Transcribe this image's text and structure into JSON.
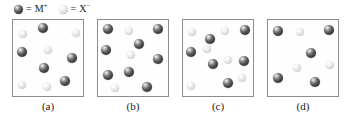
{
  "figure": {
    "caption_labels": [
      "(a)",
      "(b)",
      "(c)",
      "(d)"
    ],
    "colors": {
      "cation_dark": "#3a3a3a",
      "anion_light": "#dcdcdc",
      "box_border": "#8d8d8d",
      "text": "#1a1a1a",
      "background": "#ffffff"
    }
  },
  "legend": {
    "items": [
      {
        "icon": "dark-sphere-icon",
        "equals": "=",
        "species": "M",
        "charge": "+",
        "label": "M+",
        "type": "cation"
      },
      {
        "icon": "light-sphere-icon",
        "equals": "=",
        "species": "X",
        "charge": "−",
        "label": "X−",
        "type": "anion"
      }
    ]
  },
  "panels": [
    {
      "label": "(a)",
      "cation_count": 5,
      "anion_count": 5,
      "ratio": "1:1",
      "particles": [
        {
          "type": "anion",
          "x": 6,
          "y": 10,
          "d": 8
        },
        {
          "type": "cation",
          "x": 25,
          "y": 3,
          "d": 10
        },
        {
          "type": "anion",
          "x": 59,
          "y": 9,
          "d": 8
        },
        {
          "type": "cation",
          "x": 4,
          "y": 27,
          "d": 10
        },
        {
          "type": "anion",
          "x": 31,
          "y": 26,
          "d": 8
        },
        {
          "type": "cation",
          "x": 54,
          "y": 33,
          "d": 10
        },
        {
          "type": "cation",
          "x": 26,
          "y": 43,
          "d": 10
        },
        {
          "type": "cation",
          "x": 47,
          "y": 56,
          "d": 10
        },
        {
          "type": "anion",
          "x": 5,
          "y": 61,
          "d": 8
        },
        {
          "type": "anion",
          "x": 30,
          "y": 63,
          "d": 8
        }
      ]
    },
    {
      "label": "(b)",
      "cation_count": 8,
      "anion_count": 3,
      "ratio": "8:3",
      "particles": [
        {
          "type": "cation",
          "x": 5,
          "y": 4,
          "d": 10
        },
        {
          "type": "anion",
          "x": 27,
          "y": 7,
          "d": 8
        },
        {
          "type": "cation",
          "x": 55,
          "y": 4,
          "d": 10
        },
        {
          "type": "cation",
          "x": 3,
          "y": 25,
          "d": 10
        },
        {
          "type": "cation",
          "x": 36,
          "y": 19,
          "d": 10
        },
        {
          "type": "anion",
          "x": 29,
          "y": 31,
          "d": 8
        },
        {
          "type": "cation",
          "x": 55,
          "y": 34,
          "d": 10
        },
        {
          "type": "cation",
          "x": 5,
          "y": 50,
          "d": 10
        },
        {
          "type": "cation",
          "x": 26,
          "y": 47,
          "d": 10
        },
        {
          "type": "anion",
          "x": 13,
          "y": 64,
          "d": 8
        },
        {
          "type": "cation",
          "x": 44,
          "y": 62,
          "d": 10
        }
      ]
    },
    {
      "label": "(c)",
      "cation_count": 6,
      "anion_count": 6,
      "ratio": "1:1",
      "particles": [
        {
          "type": "anion",
          "x": 5,
          "y": 8,
          "d": 8
        },
        {
          "type": "cation",
          "x": 22,
          "y": 14,
          "d": 10
        },
        {
          "type": "anion",
          "x": 38,
          "y": 7,
          "d": 8
        },
        {
          "type": "cation",
          "x": 57,
          "y": 5,
          "d": 10
        },
        {
          "type": "cation",
          "x": 3,
          "y": 27,
          "d": 10
        },
        {
          "type": "cation",
          "x": 25,
          "y": 39,
          "d": 10
        },
        {
          "type": "anion",
          "x": 41,
          "y": 36,
          "d": 8
        },
        {
          "type": "cation",
          "x": 56,
          "y": 36,
          "d": 10
        },
        {
          "type": "anion",
          "x": 4,
          "y": 62,
          "d": 8
        },
        {
          "type": "cation",
          "x": 40,
          "y": 58,
          "d": 10
        },
        {
          "type": "anion",
          "x": 55,
          "y": 54,
          "d": 8
        },
        {
          "type": "anion",
          "x": 20,
          "y": 25,
          "d": 8
        }
      ]
    },
    {
      "label": "(d)",
      "cation_count": 5,
      "anion_count": 3,
      "ratio": "5:3",
      "particles": [
        {
          "type": "cation",
          "x": 5,
          "y": 6,
          "d": 10
        },
        {
          "type": "anion",
          "x": 28,
          "y": 8,
          "d": 8
        },
        {
          "type": "cation",
          "x": 56,
          "y": 5,
          "d": 10
        },
        {
          "type": "cation",
          "x": 38,
          "y": 28,
          "d": 10
        },
        {
          "type": "anion",
          "x": 25,
          "y": 44,
          "d": 8
        },
        {
          "type": "anion",
          "x": 58,
          "y": 41,
          "d": 8
        },
        {
          "type": "cation",
          "x": 5,
          "y": 53,
          "d": 10
        },
        {
          "type": "cation",
          "x": 42,
          "y": 57,
          "d": 10
        }
      ]
    }
  ]
}
